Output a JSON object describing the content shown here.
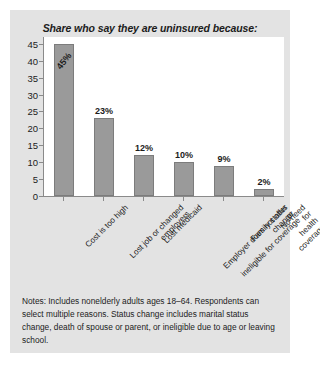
{
  "figure": {
    "background_color": "#e3e3e3",
    "plot_background_color": "#ffffff",
    "bar_color": "#9a9a9a",
    "axis_color": "#8a8a8a",
    "text_color": "#1c1c1c"
  },
  "chart_data": {
    "type": "bar",
    "title": "Share who say they are uninsured because:",
    "xlabel": "",
    "ylabel": "",
    "ylim": [
      0,
      47
    ],
    "yticks": [
      0,
      5,
      10,
      15,
      20,
      25,
      30,
      35,
      40,
      45
    ],
    "ytick_labels": [
      "0",
      "5",
      "10",
      "15",
      "20",
      "25",
      "30",
      "35",
      "40",
      "45"
    ],
    "grid": false,
    "legend": false,
    "categories": [
      "Cost is too high",
      "Lost job or changed employers",
      "Lost medicaid",
      "Employer does not offer or ineligible for coverage",
      "Family status change",
      "No need for health coverage"
    ],
    "category_lines": [
      [
        "Cost is too high"
      ],
      [
        "Lost job or changed",
        "employers"
      ],
      [
        "Lost medicaid"
      ],
      [
        "Employer does not offer or",
        "ineligible for coverage"
      ],
      [
        "Family status change"
      ],
      [
        "No need for health",
        "coverage"
      ]
    ],
    "values": [
      45,
      23,
      12,
      10,
      9,
      2
    ],
    "data_labels": [
      "45%",
      "23%",
      "12%",
      "10%",
      "9%",
      "2%"
    ],
    "label_placement": [
      "inside",
      "outside",
      "outside",
      "outside",
      "outside",
      "outside"
    ]
  },
  "notes": {
    "text": "Notes: Includes nonelderly adults ages 18–64. Respondents can select multiple reasons. Status change includes marital status change, death of spouse or parent, or ineligible due to age or leaving school."
  }
}
